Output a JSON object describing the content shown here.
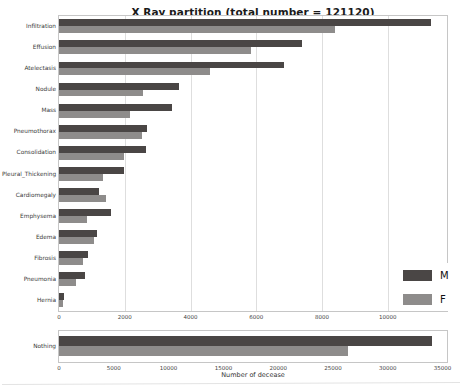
{
  "chart_data": [
    {
      "type": "bar",
      "orientation": "horizontal",
      "title": "X Ray partition (total number = 121120)",
      "categories": [
        "Infiltration",
        "Effusion",
        "Atelectasis",
        "Nodule",
        "Mass",
        "Pneumothorax",
        "Consolidation",
        "Pleural_Thickening",
        "Cardiomegaly",
        "Emphysema",
        "Edema",
        "Fibrosis",
        "Pneumonia",
        "Hernia"
      ],
      "series": [
        {
          "name": "M",
          "color": "#4a4645",
          "values": [
            11300,
            7400,
            6850,
            3650,
            3450,
            2670,
            2640,
            1970,
            1210,
            1580,
            1150,
            880,
            790,
            150
          ]
        },
        {
          "name": "F",
          "color": "#8e8c8b",
          "values": [
            8400,
            5850,
            4600,
            2550,
            2150,
            2520,
            1970,
            1330,
            1420,
            850,
            1060,
            720,
            520,
            110
          ]
        }
      ],
      "xlim": [
        0,
        11800
      ],
      "xticks": [
        0,
        2000,
        4000,
        6000,
        8000,
        10000
      ],
      "grid": true,
      "legend_position": "lower right"
    },
    {
      "type": "bar",
      "orientation": "horizontal",
      "categories": [
        "Nothing"
      ],
      "series": [
        {
          "name": "M",
          "color": "#4a4645",
          "values": [
            34000
          ]
        },
        {
          "name": "F",
          "color": "#8e8c8b",
          "values": [
            26400
          ]
        }
      ],
      "xlim": [
        0,
        35400
      ],
      "xticks": [
        0,
        5000,
        10000,
        15000,
        20000,
        25000,
        30000,
        35000
      ],
      "grid": false,
      "xlabel": "Number of decease"
    }
  ]
}
